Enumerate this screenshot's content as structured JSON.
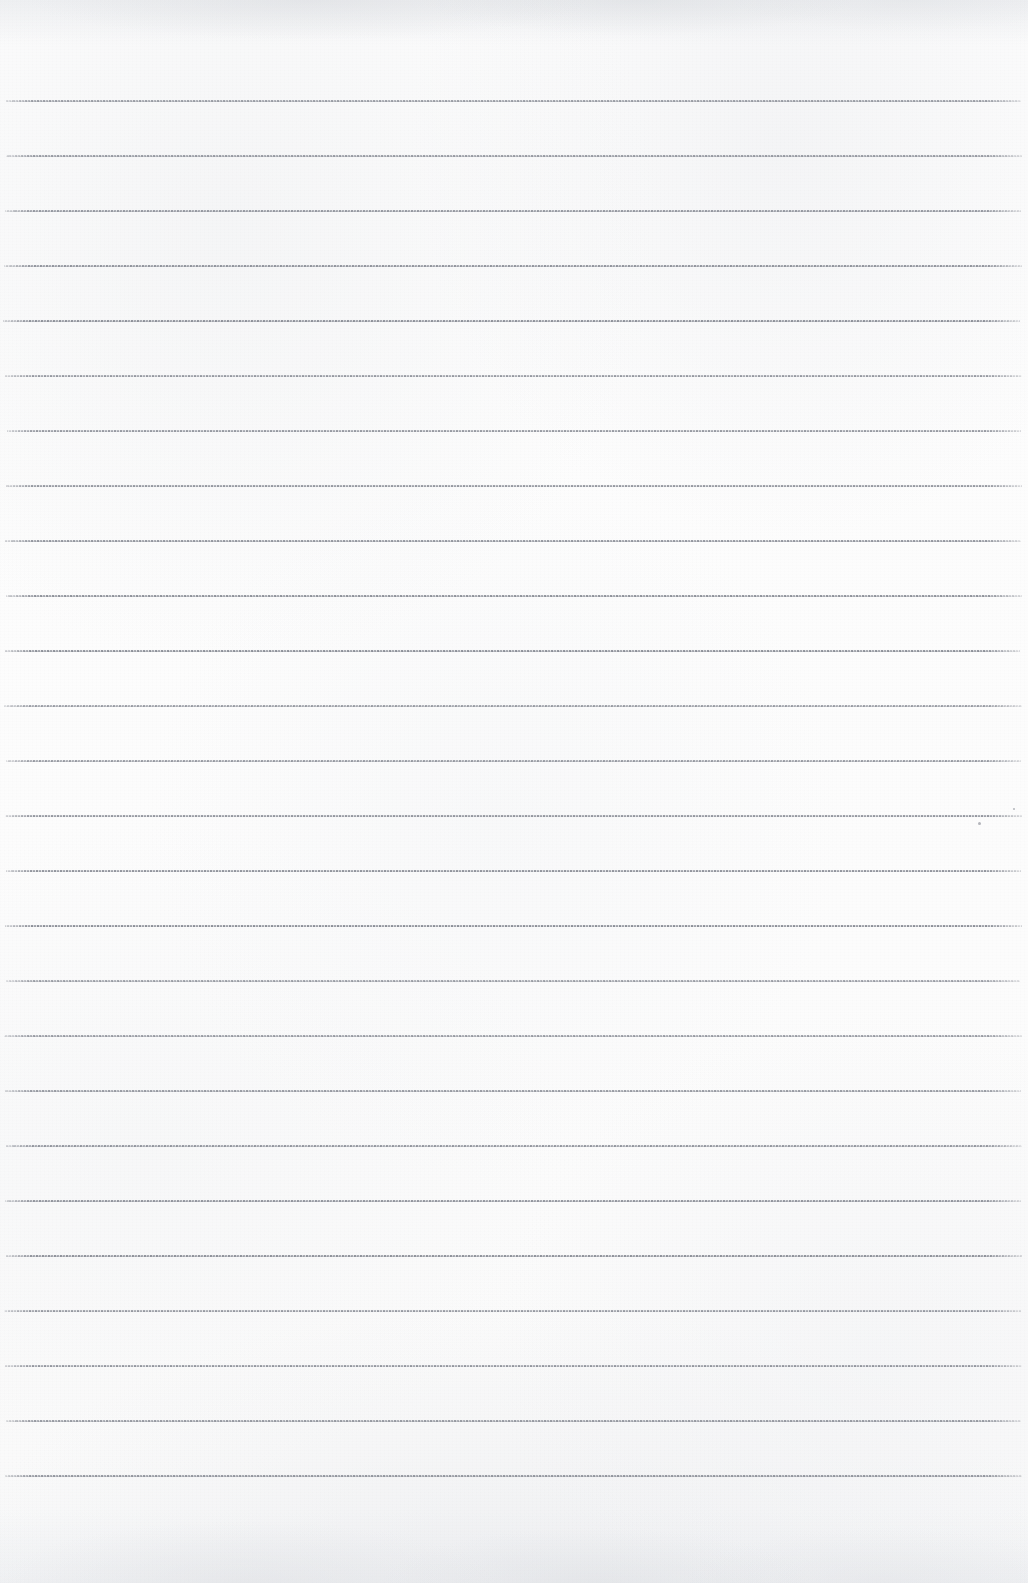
{
  "document": {
    "kind": "scanned-lined-paper",
    "title": "Blank lined notebook page",
    "page_width": 1028,
    "page_height": 1583,
    "paper_color": "#fcfcfc",
    "rule_color": "#767a84",
    "rule_style": "dashed-stippled",
    "rule_thickness_px": 2,
    "rule_spacing_px": 55,
    "rule_left_px": 5,
    "rule_right_px": 1022,
    "first_rule_y_px": 100,
    "last_rule_y_px": 1475,
    "rule_count": 26,
    "has_margin_line": false,
    "has_handwriting": false,
    "has_printed_text": false,
    "visible_text": ""
  },
  "rules": [
    {
      "index": 1,
      "y": 100,
      "x1": 6,
      "x2": 1021
    },
    {
      "index": 2,
      "y": 155,
      "x1": 6,
      "x2": 1022
    },
    {
      "index": 3,
      "y": 210,
      "x1": 5,
      "x2": 1021
    },
    {
      "index": 4,
      "y": 265,
      "x1": 4,
      "x2": 1022
    },
    {
      "index": 5,
      "y": 320,
      "x1": 3,
      "x2": 1020
    },
    {
      "index": 6,
      "y": 375,
      "x1": 5,
      "x2": 1022
    },
    {
      "index": 7,
      "y": 430,
      "x1": 7,
      "x2": 1021
    },
    {
      "index": 8,
      "y": 485,
      "x1": 6,
      "x2": 1022
    },
    {
      "index": 9,
      "y": 540,
      "x1": 5,
      "x2": 1021
    },
    {
      "index": 10,
      "y": 595,
      "x1": 6,
      "x2": 1022
    },
    {
      "index": 11,
      "y": 650,
      "x1": 5,
      "x2": 1020
    },
    {
      "index": 12,
      "y": 705,
      "x1": 4,
      "x2": 1022
    },
    {
      "index": 13,
      "y": 760,
      "x1": 6,
      "x2": 1021
    },
    {
      "index": 14,
      "y": 815,
      "x1": 5,
      "x2": 1022
    },
    {
      "index": 15,
      "y": 870,
      "x1": 6,
      "x2": 1021
    },
    {
      "index": 16,
      "y": 925,
      "x1": 5,
      "x2": 1022
    },
    {
      "index": 17,
      "y": 980,
      "x1": 6,
      "x2": 1020
    },
    {
      "index": 18,
      "y": 1035,
      "x1": 4,
      "x2": 1022
    },
    {
      "index": 19,
      "y": 1090,
      "x1": 5,
      "x2": 1021
    },
    {
      "index": 20,
      "y": 1145,
      "x1": 6,
      "x2": 1022
    },
    {
      "index": 21,
      "y": 1200,
      "x1": 5,
      "x2": 1021
    },
    {
      "index": 22,
      "y": 1255,
      "x1": 6,
      "x2": 1022
    },
    {
      "index": 23,
      "y": 1310,
      "x1": 4,
      "x2": 1021
    },
    {
      "index": 24,
      "y": 1365,
      "x1": 5,
      "x2": 1022
    },
    {
      "index": 25,
      "y": 1420,
      "x1": 6,
      "x2": 1021
    },
    {
      "index": 26,
      "y": 1475,
      "x1": 5,
      "x2": 1022
    }
  ],
  "specks": [
    {
      "x": 978,
      "y": 822,
      "size": 3
    },
    {
      "x": 1013,
      "y": 808,
      "size": 2
    }
  ]
}
